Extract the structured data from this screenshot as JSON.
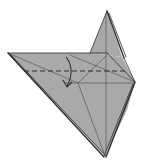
{
  "diagram": {
    "type": "origami-fold-step",
    "colors": {
      "paper_fill": "#a9a9a9",
      "paper_fill_shade": "#9d9d9d",
      "crease_line": "#4a4a4a",
      "edge_line": "#2e2e2e",
      "background": "#ffffff",
      "back_layer": "#e8e8e8"
    },
    "elements": [
      {
        "name": "top-flap",
        "kind": "paper-region"
      },
      {
        "name": "main-body",
        "kind": "paper-region"
      },
      {
        "name": "valley-fold-line",
        "kind": "dashed-line",
        "meaning": "valley fold"
      },
      {
        "name": "fold-arrow",
        "kind": "curved-arrow",
        "meaning": "fold down"
      }
    ]
  }
}
